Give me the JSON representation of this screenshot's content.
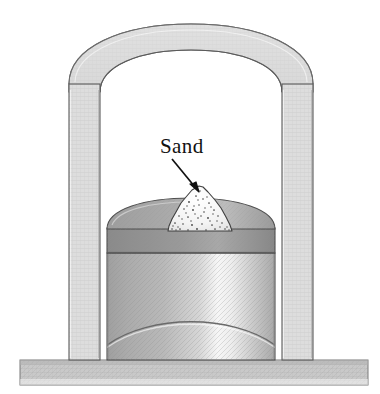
{
  "figure": {
    "title": "",
    "background_color": "#ffffff",
    "labels": [
      {
        "name": "sand-label",
        "text": "Sand",
        "x": 160,
        "y": 153,
        "font_size": 21,
        "color": "#111111"
      }
    ],
    "annotations": [
      {
        "name": "sand-arrow",
        "type": "arrow",
        "from_x": 172,
        "from_y": 159,
        "to_x": 199,
        "to_y": 192,
        "color": "#111111"
      }
    ],
    "parts": [
      {
        "name": "ground",
        "label": "ground",
        "fill": "#c9c9c9",
        "stroke": "#6f6f6f",
        "x": 20,
        "y": 360,
        "width": 348,
        "height": 25
      },
      {
        "name": "left-wall",
        "label": "left wall",
        "fill": "#d9d9d9",
        "stroke": "#5a5a5a",
        "x": 69,
        "y": 78,
        "width": 31,
        "height": 282
      },
      {
        "name": "right-wall",
        "label": "right wall",
        "fill": "#d9d9d9",
        "stroke": "#5a5a5a",
        "x": 282,
        "y": 78,
        "width": 31,
        "height": 282
      },
      {
        "name": "arch-top",
        "label": "arch top",
        "fill": "#dcdcdc",
        "stroke": "#5a5a5a"
      },
      {
        "name": "cylinder-body",
        "label": "cylinder body",
        "fill_light": "#f2f2f2",
        "fill_dark": "#a9a9a9",
        "stroke": "#4f4f4f",
        "x": 107,
        "y": 253,
        "width": 168,
        "height": 107
      },
      {
        "name": "piston-band",
        "label": "piston band",
        "fill": "#8d8d8d",
        "stroke": "#4f4f4f",
        "x": 107,
        "y": 228,
        "width": 168,
        "height": 25
      },
      {
        "name": "piston-dome-cap",
        "label": "dome cap",
        "fill": "#a6a6a6",
        "stroke": "#4f4f4f"
      },
      {
        "name": "sand-pile",
        "label": "sand pile",
        "fill": "#f4f4f4",
        "stroke": "#3a3a3a",
        "speckle_color": "#3f3f3f"
      },
      {
        "name": "cylinder-bottom-arc",
        "label": "cylinder bottom arc",
        "stroke": "#6a6a6a"
      }
    ],
    "colors": {
      "ink": "#111111",
      "outline": "#5a5a5a",
      "wall_fill": "#d9d9d9",
      "dome_fill": "#a6a6a6",
      "band_fill": "#8d8d8d",
      "ground_fill": "#c9c9c9",
      "sand_fill": "#f4f4f4",
      "page": "#ffffff"
    }
  }
}
